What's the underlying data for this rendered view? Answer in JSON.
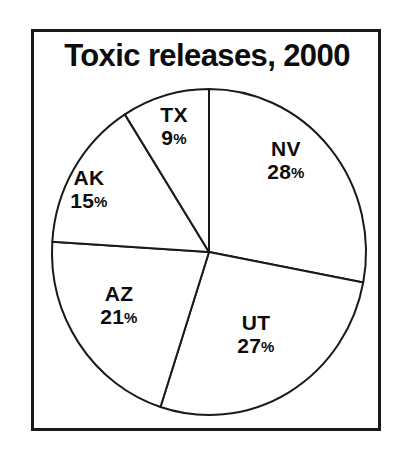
{
  "figure": {
    "title": "Toxic releases, 2000",
    "frame_color": "#1a1a1a",
    "background_color": "#ffffff",
    "ink_color": "#0d0d0d"
  },
  "chart_data": {
    "type": "pie",
    "title": "Toxic releases, 2000",
    "xlabel": "",
    "ylabel": "",
    "categories": [
      "NV",
      "UT",
      "AZ",
      "AK",
      "TX"
    ],
    "values": [
      28,
      27,
      21,
      15,
      9
    ],
    "units": "percent",
    "total": 100,
    "start_angle_deg": 0,
    "direction": "clockwise",
    "legend": "none",
    "grid": false,
    "slice_fill": "#ffffff",
    "slice_stroke": "#1a1a1a",
    "slices": [
      {
        "label": "NV",
        "value": 28,
        "value_text": "28",
        "percent_symbol": "%",
        "start_deg": 0.0,
        "end_deg": 100.8
      },
      {
        "label": "UT",
        "value": 27,
        "value_text": "27",
        "percent_symbol": "%",
        "start_deg": 100.8,
        "end_deg": 198.0
      },
      {
        "label": "AZ",
        "value": 21,
        "value_text": "21",
        "percent_symbol": "%",
        "start_deg": 198.0,
        "end_deg": 273.6
      },
      {
        "label": "AK",
        "value": 15,
        "value_text": "15",
        "percent_symbol": "%",
        "start_deg": 273.6,
        "end_deg": 327.6
      },
      {
        "label": "TX",
        "value": 9,
        "value_text": "9",
        "percent_symbol": "%",
        "start_deg": 327.6,
        "end_deg": 360.0
      }
    ]
  }
}
